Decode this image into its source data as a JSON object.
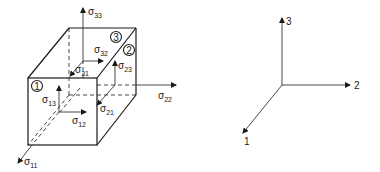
{
  "figure": {
    "cube": {
      "face_markers": [
        {
          "id": "1",
          "label": "1"
        },
        {
          "id": "2",
          "label": "2"
        },
        {
          "id": "3",
          "label": "3"
        }
      ],
      "stress_labels": {
        "s11": {
          "symbol": "σ",
          "sub": "11"
        },
        "s12": {
          "symbol": "σ",
          "sub": "12"
        },
        "s13": {
          "symbol": "σ",
          "sub": "13"
        },
        "s21": {
          "symbol": "σ",
          "sub": "21"
        },
        "s22": {
          "symbol": "σ",
          "sub": "22"
        },
        "s23": {
          "symbol": "σ",
          "sub": "23"
        },
        "s31": {
          "symbol": "σ",
          "sub": "31"
        },
        "s32": {
          "symbol": "σ",
          "sub": "32"
        },
        "s33": {
          "symbol": "σ",
          "sub": "33"
        }
      }
    },
    "axes": {
      "x1": "1",
      "x2": "2",
      "x3": "3"
    },
    "colors": {
      "line": "#1a1a1a",
      "background": "#ffffff"
    }
  }
}
